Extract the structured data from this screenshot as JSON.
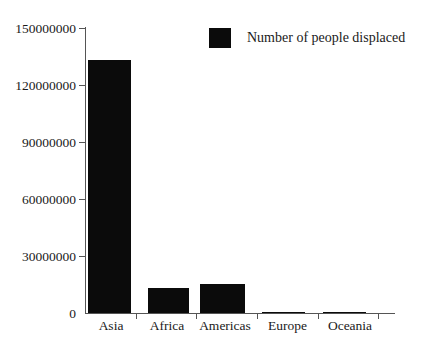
{
  "chart_data": {
    "type": "bar",
    "title": "",
    "subtitle": "",
    "xlabel": "",
    "ylabel": "",
    "categories": [
      "Asia",
      "Africa",
      "Americas",
      "Europe",
      "Oceania"
    ],
    "series": [
      {
        "name": "Number of people displaced",
        "color": "#0b0b0b",
        "values": [
          133000000,
          13200000,
          15300000,
          0,
          0
        ]
      }
    ],
    "values": [
      133000000,
      13200000,
      15300000,
      0,
      0
    ],
    "ylim": [
      0,
      150000000
    ],
    "yticks": [
      0,
      30000000,
      60000000,
      90000000,
      120000000,
      150000000
    ],
    "ytick_labels": [
      "0",
      "30000000",
      "60000000",
      "90000000",
      "120000000",
      "150000000"
    ],
    "grid": false,
    "legend_position": "top-right",
    "legend": [
      {
        "label": "Number of people displaced",
        "color": "#0b0b0b"
      }
    ],
    "annotations": []
  },
  "legend": {
    "label": "Number of people displaced"
  },
  "axes": {
    "y_tick_labels": [
      "150000000",
      "120000000",
      "90000000",
      "60000000",
      "30000000",
      "0"
    ],
    "x_tick_labels": [
      "Asia",
      "Africa",
      "Americas",
      "Europe",
      "Oceania"
    ]
  },
  "colors": {
    "bar": "#0b0b0b",
    "axis": "#555555",
    "text": "#1a1a1a",
    "background": "#ffffff"
  }
}
